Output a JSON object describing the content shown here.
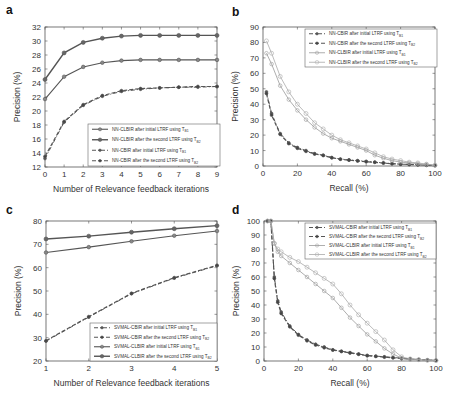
{
  "chart_data": [
    {
      "panel": "a",
      "type": "line",
      "title": "",
      "xlabel": "Number of Relevance feedback iterations",
      "ylabel": "Precision (%)",
      "xlim": [
        0,
        9
      ],
      "ylim": [
        12,
        32
      ],
      "xticks": [
        0,
        1,
        2,
        3,
        4,
        5,
        6,
        7,
        8,
        9
      ],
      "yticks": [
        12,
        14,
        16,
        18,
        20,
        22,
        24,
        26,
        28,
        30,
        32
      ],
      "grid": false,
      "legend_position": "lower right",
      "x": [
        0,
        1,
        2,
        3,
        4,
        5,
        6,
        7,
        8,
        9
      ],
      "series": [
        {
          "name": "NN-CLBIR after initial LTRF using T_B1",
          "style": "solid-circle",
          "values": [
            21.7,
            24.9,
            26.3,
            26.9,
            27.2,
            27.3,
            27.3,
            27.3,
            27.3,
            27.3
          ]
        },
        {
          "name": "NN-CLBIR after the second LTRF using T_B2",
          "style": "solid-circle-bold",
          "values": [
            24.5,
            28.3,
            29.8,
            30.4,
            30.7,
            30.8,
            30.8,
            30.8,
            30.8,
            30.8
          ]
        },
        {
          "name": "NN-CBIR after initial LTRF using T_B1",
          "style": "dashdot-star",
          "values": [
            13.2,
            18.4,
            20.8,
            22.1,
            22.8,
            23.1,
            23.3,
            23.4,
            23.4,
            23.5
          ]
        },
        {
          "name": "NN-CBIR after the second LTRF using T_B2",
          "style": "dashed-star",
          "values": [
            13.5,
            18.5,
            20.9,
            22.2,
            22.9,
            23.2,
            23.3,
            23.4,
            23.5,
            23.5
          ]
        }
      ]
    },
    {
      "panel": "b",
      "type": "line",
      "title": "",
      "xlabel": "Recall (%)",
      "ylabel": "Precision (%)",
      "xlim": [
        0,
        100
      ],
      "ylim": [
        0,
        90
      ],
      "xticks": [
        0,
        20,
        40,
        60,
        80,
        100
      ],
      "yticks": [
        0,
        10,
        20,
        30,
        40,
        50,
        60,
        70,
        80,
        90
      ],
      "grid": false,
      "legend_position": "upper right",
      "x": [
        2,
        5,
        10,
        15,
        20,
        25,
        30,
        35,
        40,
        45,
        50,
        55,
        60,
        65,
        70,
        75,
        80,
        85,
        90,
        95,
        100
      ],
      "series": [
        {
          "name": "NN-CBIR after initial LTRF using T_B1",
          "style": "dashdot-star",
          "values": [
            48,
            34,
            21,
            15,
            12,
            10,
            8,
            7,
            5.5,
            4.5,
            4,
            3.5,
            3,
            2.5,
            2,
            1.5,
            1.2,
            1,
            0.8,
            0.5,
            0.3
          ]
        },
        {
          "name": "NN-CBIR after the second LTRF using T_B2",
          "style": "dashed-star",
          "values": [
            47,
            33,
            20.5,
            14.5,
            11.5,
            9.5,
            7.8,
            6.8,
            5.3,
            4.4,
            3.8,
            3.3,
            2.8,
            2.4,
            1.9,
            1.5,
            1.2,
            1,
            0.8,
            0.5,
            0.3
          ]
        },
        {
          "name": "NN-CLBIR after initial LTRF using T_B1",
          "style": "solid-circle-open",
          "values": [
            73,
            66,
            52,
            43,
            36,
            30,
            25,
            21,
            18,
            16,
            14,
            12,
            10,
            7,
            5,
            3.5,
            2.5,
            2,
            1.5,
            1,
            0.5
          ]
        },
        {
          "name": "NN-CLBIR after the second LTRF using T_B2",
          "style": "solid-square-open",
          "values": [
            81,
            73,
            58,
            48,
            40,
            34,
            28,
            24,
            20,
            17,
            15,
            13,
            11,
            8.5,
            6,
            4.5,
            3.5,
            2.5,
            2,
            1.2,
            0.5
          ]
        }
      ]
    },
    {
      "panel": "c",
      "type": "line",
      "title": "",
      "xlabel": "Number of Relevance feedback iterations",
      "ylabel": "Precision (%)",
      "xlim": [
        1,
        5
      ],
      "ylim": [
        20,
        80
      ],
      "xticks": [
        1,
        2,
        3,
        4,
        5
      ],
      "yticks": [
        20,
        30,
        40,
        50,
        60,
        70,
        80
      ],
      "grid": false,
      "legend_position": "lower right",
      "x": [
        1,
        2,
        3,
        4,
        5
      ],
      "series": [
        {
          "name": "SVMAL-CBIR after initial LTRF using T_B1",
          "style": "dashdot-star",
          "values": [
            28.5,
            38.8,
            48.8,
            55.5,
            60.8
          ]
        },
        {
          "name": "SVMAL-CBIR after the second LTRF using T_B2",
          "style": "dashed-star",
          "values": [
            28.7,
            39.0,
            49.0,
            55.7,
            61.0
          ]
        },
        {
          "name": "SVMAL-CLBIR after initial LTRF using T_B1",
          "style": "solid-circle",
          "values": [
            66.5,
            68.8,
            71.3,
            73.7,
            75.7
          ]
        },
        {
          "name": "SVMAL-CLBIR after the second LTRF using T_B2",
          "style": "solid-circle-bold",
          "values": [
            72.3,
            73.5,
            75.2,
            76.7,
            78.0
          ]
        }
      ]
    },
    {
      "panel": "d",
      "type": "line",
      "title": "",
      "xlabel": "Recall (%)",
      "ylabel": "Precision (%)",
      "xlim": [
        0,
        100
      ],
      "ylim": [
        0,
        100
      ],
      "xticks": [
        0,
        20,
        40,
        60,
        80,
        100
      ],
      "yticks": [
        0,
        10,
        20,
        30,
        40,
        50,
        60,
        70,
        80,
        90,
        100
      ],
      "grid": false,
      "legend_position": "upper right",
      "x": [
        2,
        4,
        6,
        8,
        10,
        15,
        20,
        25,
        30,
        35,
        40,
        45,
        50,
        55,
        60,
        65,
        70,
        75,
        80,
        85,
        90,
        95,
        100
      ],
      "series": [
        {
          "name": "SVMAL-CBIR after initial LTRF using T_B1",
          "style": "dashdot-star",
          "values": [
            100,
            100,
            60,
            43,
            35,
            25,
            19,
            15,
            12,
            10,
            8,
            7,
            6,
            5,
            4,
            3.5,
            3,
            2.5,
            2,
            1.5,
            1,
            0.7,
            0.5
          ]
        },
        {
          "name": "SVMAL-CBIR after the second LTRF using T_B2",
          "style": "dashed-star",
          "values": [
            100,
            100,
            59,
            42,
            34,
            24.5,
            18.5,
            14.5,
            11.5,
            9.5,
            7.8,
            6.8,
            5.8,
            4.8,
            3.8,
            3.3,
            2.8,
            2.3,
            1.8,
            1.4,
            1,
            0.7,
            0.5
          ]
        },
        {
          "name": "SVMAL-CLBIR after initial LTRF using T_B1",
          "style": "solid-circle-open",
          "values": [
            100,
            100,
            84,
            78,
            75,
            70,
            65,
            60,
            55,
            50,
            45,
            38,
            31,
            25,
            19,
            14,
            9,
            5,
            2,
            1,
            0.8,
            0.5,
            0.3
          ]
        },
        {
          "name": "SVMAL-CLBIR after the second LTRF using T_B2",
          "style": "solid-square-open",
          "values": [
            100,
            100,
            84,
            80,
            78,
            74,
            71,
            67,
            63,
            59,
            55,
            48,
            40,
            33,
            27,
            21,
            15,
            8,
            3,
            1.5,
            1,
            0.6,
            0.3
          ]
        }
      ]
    }
  ],
  "panels": {
    "a": {
      "label": "a",
      "xlabel": "Number of Relevance feedback iterations",
      "ylabel": "Precision (%)",
      "legend": [
        "NN-CLBIR after initial LTRF using T",
        "NN-CLBIR after the second LTRF using T",
        "NN-CBIR after initial LTRF using T",
        "NN-CBIR after the second LTRF using T"
      ],
      "legend_sub": [
        "B1",
        "B2",
        "B1",
        "B2"
      ]
    },
    "b": {
      "label": "b",
      "xlabel": "Recall (%)",
      "ylabel": "Precision (%)",
      "legend": [
        "NN-CBIR after initial LTRF using T",
        "NN-CBIR after the second LTRF using T",
        "NN-CLBIR after initial LTRF using T",
        "NN-CLBIR after the second LTRF using T"
      ],
      "legend_sub": [
        "B1",
        "B2",
        "B1",
        "B2"
      ]
    },
    "c": {
      "label": "c",
      "xlabel": "Number of Relevance feedback iterations",
      "ylabel": "Precision (%)",
      "legend": [
        "SVMAL-CBIR after initial LTRF using T",
        "SVMAL-CBIR after the second LTRF using T",
        "SVMAL-CLBIR after initial LTRF using T",
        "SVMAL-CLBIR after the second LTRF using T"
      ],
      "legend_sub": [
        "B1",
        "B2",
        "B1",
        "B2"
      ]
    },
    "d": {
      "label": "d",
      "xlabel": "Recall (%)",
      "ylabel": "Precision (%)",
      "legend": [
        "SVMAL-CBIR after initial LTRF using T",
        "SVMAL-CBIR after the second LTRF using T",
        "SVMAL-CLBIR after initial LTRF using T",
        "SVMAL-CLBIR after the second LTRF using T"
      ],
      "legend_sub": [
        "B1",
        "B2",
        "B1",
        "B2"
      ]
    }
  },
  "colors": {
    "axis": "#555555",
    "solid_line": "#555555",
    "dashed_line": "#555555",
    "marker_fill": "#777777",
    "open_marker": "#999999"
  }
}
